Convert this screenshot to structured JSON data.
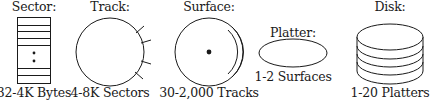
{
  "diagram": {
    "items": [
      {
        "id": "sector",
        "title": "Sector:",
        "caption": "32-4K Bytes"
      },
      {
        "id": "track",
        "title": "Track:",
        "caption": "4-8K Sectors"
      },
      {
        "id": "surface",
        "title": "Surface:",
        "caption": "30-2,000 Tracks"
      },
      {
        "id": "platter",
        "title": "Platter:",
        "caption": "1-2 Surfaces"
      },
      {
        "id": "disk",
        "title": "Disk:",
        "caption": "1-20 Platters"
      }
    ],
    "stroke_color": "#1a1a1a",
    "background": "#ffffff"
  }
}
